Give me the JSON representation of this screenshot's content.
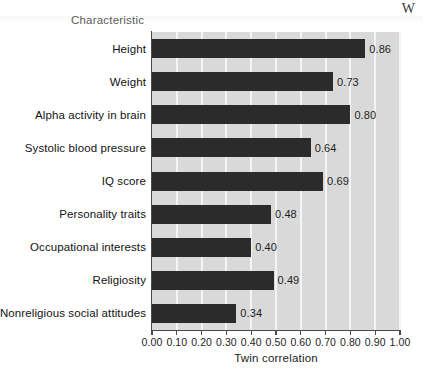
{
  "page": {
    "header_fragment": "W",
    "bleed_text_bottom": ""
  },
  "chart_data": {
    "type": "bar",
    "orientation": "horizontal",
    "title": "",
    "xlabel": "Twin correlation",
    "ylabel": "Characteristic",
    "categories": [
      "Height",
      "Weight",
      "Alpha activity in brain",
      "Systolic blood pressure",
      "IQ score",
      "Personality traits",
      "Occupational interests",
      "Religiosity",
      "Nonreligious social attitudes"
    ],
    "values": [
      0.86,
      0.73,
      0.8,
      0.64,
      0.69,
      0.48,
      0.4,
      0.49,
      0.34
    ],
    "value_labels": [
      "0.86",
      "0.73",
      "0.80",
      "0.64",
      "0.69",
      "0.48",
      "0.40",
      "0.49",
      "0.34"
    ],
    "xlim": [
      0.0,
      1.0
    ],
    "xticks": [
      0.0,
      0.1,
      0.2,
      0.3,
      0.4,
      0.5,
      0.6,
      0.7,
      0.8,
      0.9,
      1.0
    ],
    "xtick_labels": [
      "0.00",
      "0.10",
      "0.20",
      "0.30",
      "0.40",
      "0.50",
      "0.60",
      "0.70",
      "0.80",
      "0.90",
      "1.00"
    ],
    "grid": true,
    "legend": null,
    "colors": {
      "bar": "#2b2b2b",
      "plot_background": "#d9d9d9",
      "gridline": "#f4f4f4",
      "axis": "#4a4a4a",
      "text": "#1d1d1d",
      "ylabel_text": "#5d5d5d"
    }
  }
}
